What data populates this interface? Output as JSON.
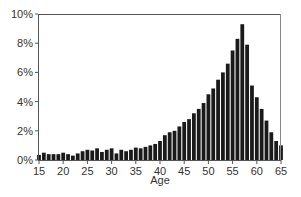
{
  "chart_data": {
    "type": "bar",
    "title": "",
    "xlabel": "Age",
    "ylabel": "",
    "xlim": [
      15,
      65
    ],
    "ylim": [
      0,
      10
    ],
    "grid": false,
    "legend": null,
    "x_ticks": [
      15,
      20,
      25,
      30,
      35,
      40,
      45,
      50,
      55,
      60,
      65
    ],
    "y_ticks": [
      "0%",
      "2%",
      "4%",
      "6%",
      "8%",
      "10%"
    ],
    "y_tick_values": [
      0,
      2,
      4,
      6,
      8,
      10
    ],
    "bar_color": "#1a1a1a",
    "categories": [
      15,
      16,
      17,
      18,
      19,
      20,
      21,
      22,
      23,
      24,
      25,
      26,
      27,
      28,
      29,
      30,
      31,
      32,
      33,
      34,
      35,
      36,
      37,
      38,
      39,
      40,
      41,
      42,
      43,
      44,
      45,
      46,
      47,
      48,
      49,
      50,
      51,
      52,
      53,
      54,
      55,
      56,
      57,
      58,
      59,
      60,
      61,
      62,
      63,
      64,
      65
    ],
    "values": [
      0.35,
      0.5,
      0.4,
      0.4,
      0.4,
      0.5,
      0.4,
      0.3,
      0.45,
      0.6,
      0.7,
      0.65,
      0.8,
      0.55,
      0.7,
      0.8,
      0.45,
      0.7,
      0.6,
      0.7,
      0.85,
      0.8,
      0.9,
      1.0,
      1.1,
      1.3,
      1.7,
      1.9,
      2.0,
      2.3,
      2.6,
      2.8,
      3.2,
      3.5,
      3.9,
      4.5,
      4.9,
      5.5,
      6.0,
      6.6,
      7.5,
      8.3,
      9.3,
      7.9,
      5.1,
      4.3,
      3.5,
      2.7,
      1.9,
      1.3,
      1.0
    ],
    "value_unit": "%"
  }
}
